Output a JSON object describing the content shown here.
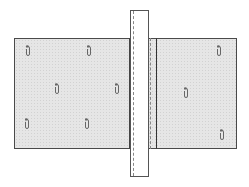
{
  "diagram": {
    "title": "",
    "colors": {
      "panel_fill": "#e6e6e6",
      "outline": "#4a4a4a",
      "strip_fill": "#ffffff",
      "pin": "#666666"
    },
    "panels": [
      {
        "id": "left-panel",
        "x": 14,
        "y": 38,
        "w": 118,
        "h": 111,
        "pins": [
          [
            28,
            50
          ],
          [
            89,
            50
          ],
          [
            57,
            88
          ],
          [
            117,
            88
          ],
          [
            27,
            123
          ],
          [
            87,
            123
          ]
        ]
      },
      {
        "id": "right-panel",
        "x": 155,
        "y": 38,
        "w": 82,
        "h": 111,
        "pins": [
          [
            219,
            50
          ],
          [
            186,
            92
          ],
          [
            222,
            134
          ]
        ]
      }
    ],
    "strip": {
      "x": 130,
      "y": 10,
      "w": 19,
      "h": 167
    }
  }
}
